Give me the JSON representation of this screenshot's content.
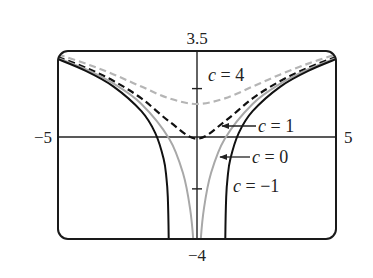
{
  "chart_data": {
    "type": "line",
    "title": "",
    "xlabel": "",
    "ylabel": "",
    "xlim": [
      -5,
      5
    ],
    "ylim": [
      -4,
      3.5
    ],
    "grid": false,
    "legend": "inline annotations",
    "tick_labels": {
      "x_min": "−5",
      "x_max": "5",
      "y_min": "−4",
      "y_max": "3.5"
    },
    "y_ticks": [
      2,
      -2
    ],
    "series": [
      {
        "name": "c = 4",
        "function": "ln(x^2 + 4)",
        "style": "dashed",
        "color": "#b5b5b5",
        "x": [
          -5,
          -4,
          -3,
          -2,
          -1,
          0,
          1,
          2,
          3,
          4,
          5
        ],
        "y": [
          3.367,
          2.996,
          2.565,
          2.079,
          1.609,
          1.386,
          1.609,
          2.079,
          2.565,
          2.996,
          3.367
        ]
      },
      {
        "name": "c = 1",
        "function": "ln(x^2 + 1)",
        "style": "dashed",
        "color": "#111111",
        "x": [
          -5,
          -4,
          -3,
          -2,
          -1,
          0,
          1,
          2,
          3,
          4,
          5
        ],
        "y": [
          3.258,
          2.833,
          2.303,
          1.609,
          0.693,
          0,
          0.693,
          1.609,
          2.303,
          2.833,
          3.258
        ]
      },
      {
        "name": "c = 0",
        "function": "ln(x^2)",
        "style": "solid",
        "color": "#a8a8a8",
        "x": [
          -5,
          -4,
          -3,
          -2,
          -1,
          -0.5,
          -0.25,
          -0.135,
          0.135,
          0.25,
          0.5,
          1,
          2,
          3,
          4,
          5
        ],
        "y": [
          3.219,
          2.773,
          2.197,
          1.386,
          0,
          -1.386,
          -2.773,
          -4.0,
          -4.0,
          -2.773,
          -1.386,
          0,
          1.386,
          2.197,
          2.773,
          3.219
        ]
      },
      {
        "name": "c = −1",
        "function": "ln(x^2 - 1)",
        "style": "solid",
        "color": "#111111",
        "x": [
          -5,
          -4,
          -3,
          -2,
          -1.5,
          -1.2,
          -1.1,
          -1.05,
          -1.018,
          1.018,
          1.05,
          1.1,
          1.2,
          1.5,
          2,
          3,
          4,
          5
        ],
        "y": [
          3.178,
          2.708,
          2.079,
          1.099,
          0.223,
          -0.799,
          -1.55,
          -2.32,
          -4.0,
          -4.0,
          -2.32,
          -1.55,
          -0.799,
          0.223,
          1.099,
          2.079,
          2.708,
          3.178
        ]
      }
    ],
    "annotations": [
      {
        "text_var": "c",
        "text_rest": " = 4",
        "x_px": 208,
        "y_px": 81,
        "arrow": false
      },
      {
        "text_var": "c",
        "text_rest": " = 1",
        "x_px": 258,
        "y_px": 132,
        "arrow": true,
        "arrow_from_px": [
          256,
          126
        ],
        "arrow_to_px": [
          222,
          126
        ]
      },
      {
        "text_var": "c",
        "text_rest": " = 0",
        "x_px": 252,
        "y_px": 163,
        "arrow": true,
        "arrow_from_px": [
          250,
          157
        ],
        "arrow_to_px": [
          220,
          157
        ]
      },
      {
        "text_var": "c",
        "text_rest": " = −1",
        "x_px": 233,
        "y_px": 192,
        "arrow": false
      }
    ]
  }
}
